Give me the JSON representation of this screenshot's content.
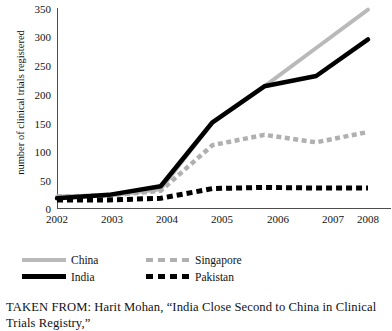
{
  "chart_data": {
    "type": "line",
    "title": "",
    "xlabel": "",
    "ylabel": "number of clinical trials registered",
    "categories": [
      "2002",
      "2003",
      "2004",
      "2005",
      "2006",
      "2007",
      "2008"
    ],
    "x": [
      2002,
      2003,
      2004,
      2005,
      2006,
      2007,
      2008
    ],
    "ylim": [
      0,
      350
    ],
    "xlim": [
      2002,
      2008
    ],
    "yticks": [
      0,
      50,
      100,
      150,
      200,
      250,
      300,
      350
    ],
    "grid": false,
    "legend_position": "below-left",
    "series": [
      {
        "name": "China",
        "color": "#b9b9b9",
        "style": "solid",
        "values": [
          20,
          22,
          33,
          150,
          213,
          280,
          347
        ]
      },
      {
        "name": "India",
        "color": "#000000",
        "style": "solid",
        "values": [
          17,
          23,
          38,
          150,
          213,
          231,
          295
        ]
      },
      {
        "name": "Singapore",
        "color": "#b0b0b0",
        "style": "dashed",
        "values": [
          20,
          22,
          30,
          110,
          128,
          115,
          133
        ]
      },
      {
        "name": "Pakistan",
        "color": "#000000",
        "style": "dashed",
        "values": [
          14,
          14,
          17,
          34,
          36,
          35,
          35
        ]
      }
    ]
  },
  "axis": {
    "y_label": "number of clinical trials registered",
    "y_ticks": [
      "350",
      "300",
      "250",
      "200",
      "150",
      "100",
      "50",
      "0"
    ],
    "x_ticks": [
      "2002",
      "2003",
      "2004",
      "2005",
      "2006",
      "2007",
      "2008"
    ]
  },
  "legend": {
    "items": [
      {
        "label": "China"
      },
      {
        "label": "Singapore"
      },
      {
        "label": "India"
      },
      {
        "label": "Pakistan"
      }
    ]
  },
  "caption": {
    "line1": "TAKEN FROM: Harit Mohan, “India Close Second to China in Clinical",
    "line2": "Trials Registry,”"
  }
}
